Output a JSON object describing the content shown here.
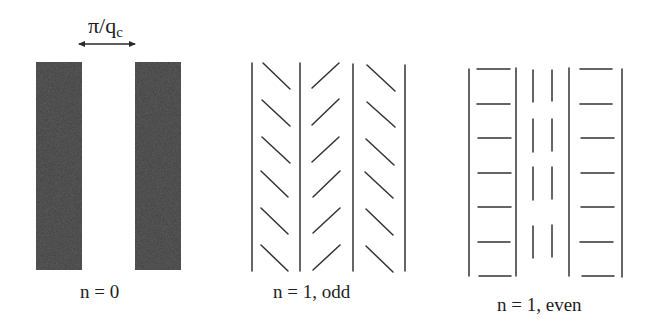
{
  "figure": {
    "panels": [
      {
        "id": "n0",
        "caption": "n = 0",
        "annotation": {
          "symbol": "π/q",
          "subscript": "c",
          "type": "double-headed-arrow"
        },
        "description": "two dark shaded vertical bars separated by gap π/q_c"
      },
      {
        "id": "n1-odd",
        "caption": "n = 1, odd",
        "description": "four vertical lines with herringbone diagonal segments (\\ / \\), 6 per column"
      },
      {
        "id": "n1-even",
        "caption": "n = 1, even",
        "description": "four vertical lines with horizontal segments in outer columns (7 each) and two dashed vertical lines in center column (4 dashes each)"
      }
    ],
    "colors": {
      "ink": "#2a2a2a",
      "bar_fill": "#565656"
    }
  }
}
